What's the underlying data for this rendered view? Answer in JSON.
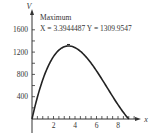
{
  "chart_data": {
    "type": "line",
    "title": "",
    "xlabel": "x",
    "ylabel": "V",
    "xlim": [
      0,
      10
    ],
    "ylim": [
      0,
      1800
    ],
    "x_ticks": [
      2,
      4,
      6,
      8
    ],
    "x_minor_step": 0.5,
    "y_ticks": [
      400,
      800,
      1200,
      1600
    ],
    "y_minor_step": 200,
    "x_tick_labels": [
      "2",
      "4",
      "6",
      "8"
    ],
    "y_tick_labels": [
      "400",
      "800",
      "1200",
      "1600"
    ],
    "series": [
      {
        "name": "V(x) = 2x(18 - 2x)(24 - 2x)",
        "x": [
          0,
          0.5,
          1,
          1.5,
          2,
          2.5,
          3,
          3.3944487,
          4,
          4.5,
          5,
          5.5,
          6,
          6.5,
          7,
          7.5,
          8,
          8.5,
          9
        ],
        "y": [
          0,
          391,
          704,
          945,
          1120,
          1235,
          1296,
          1309.9547,
          1280,
          1215,
          1120,
          999,
          864,
          715,
          560,
          405,
          256,
          119,
          0
        ]
      }
    ],
    "annotation": {
      "label": "Maximum",
      "text": "X = 3.3944487 Y = 1309.9547",
      "x": 3.3944487,
      "y": 1309.9547
    },
    "grid": false,
    "legend": "none"
  }
}
